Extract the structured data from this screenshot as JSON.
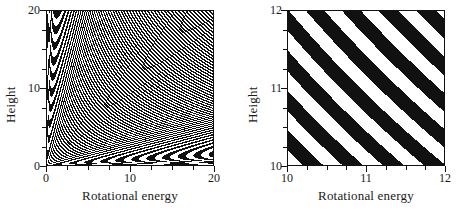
{
  "figure": {
    "background": "#ffffff",
    "ink": "#111111",
    "panels": [
      {
        "id": "left",
        "xlabel": "Rotational energy",
        "ylabel": "Height",
        "xlim": [
          0,
          20
        ],
        "ylim": [
          0,
          20
        ],
        "xticks_major": [
          0,
          10,
          20
        ],
        "xticklabels": [
          "0",
          "10",
          "20"
        ],
        "yticks_major": [
          0,
          10,
          20
        ],
        "yticklabels": [
          "0",
          "10",
          "20"
        ],
        "xticks_minor": [
          2.5,
          5,
          7.5,
          12.5,
          15,
          17.5
        ],
        "yticks_minor": [
          2.5,
          5,
          7.5,
          12.5,
          15,
          17.5
        ]
      },
      {
        "id": "right",
        "xlabel": "Rotational energy",
        "ylabel": "Height",
        "xlim": [
          10,
          12
        ],
        "ylim": [
          10,
          12
        ],
        "xticks_major": [
          10,
          11,
          12
        ],
        "xticklabels": [
          "10",
          "11",
          "12"
        ],
        "yticks_major": [
          10,
          11,
          12
        ],
        "yticklabels": [
          "10",
          "11",
          "12"
        ],
        "xticks_minor": [
          10.25,
          10.5,
          10.75,
          11.25,
          11.5,
          11.75
        ],
        "yticks_minor": [
          10.25,
          10.5,
          10.75,
          11.25,
          11.5,
          11.75
        ]
      }
    ]
  },
  "chart_data": [
    {
      "type": "heatmap",
      "title": "",
      "xlabel": "Rotational energy",
      "ylabel": "Height",
      "xlim": [
        0,
        20
      ],
      "ylim": [
        0,
        20
      ],
      "xticklabels": [
        "0",
        "10",
        "20"
      ],
      "yticklabels": [
        "0",
        "10",
        "20"
      ],
      "grid": false,
      "legend": "none",
      "colormap": [
        "#ffffff",
        "#111111"
      ],
      "field": "binary_fringe",
      "description": "Black/white fringe pattern; dark bands are hyperbolae of constant product of rotational energy and height. Fringe density increases toward upper right; lowest band asymptotes to the two axes.",
      "fringe_rule": "dark where fractional part of sqrt(x*y) scaled by fringe_frequency falls below duty",
      "fringe_frequency": 4.05,
      "fringe_phase": 0.12,
      "duty": 0.52
    },
    {
      "type": "heatmap",
      "title": "",
      "xlabel": "Rotational energy",
      "ylabel": "Height",
      "xlim": [
        10,
        12
      ],
      "ylim": [
        10,
        12
      ],
      "xticklabels": [
        "10",
        "11",
        "12"
      ],
      "yticklabels": [
        "10",
        "11",
        "12"
      ],
      "grid": false,
      "legend": "none",
      "colormap": [
        "#ffffff",
        "#111111"
      ],
      "field": "binary_fringe",
      "description": "Magnified detail of the same fringe field over the sub-region 10-12 in both coordinates; bands appear as broad straight diagonals running from upper-left to lower-right, with a white wedge at lower left and a thin white sliver near the upper-right corner.",
      "fringe_rule": "dark where fractional part of sqrt(x*y) scaled by fringe_frequency falls below duty",
      "fringe_frequency": 4.05,
      "fringe_phase": 0.12,
      "duty": 0.52
    }
  ]
}
